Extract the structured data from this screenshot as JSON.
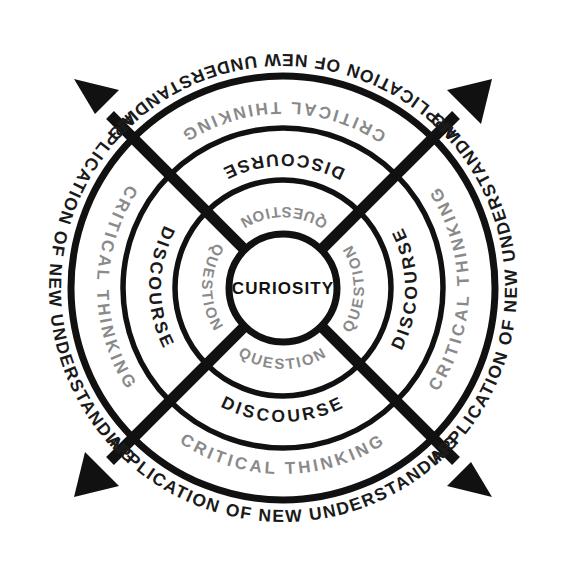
{
  "diagram": {
    "type": "concentric-ring-cycle",
    "center": {
      "label": "CURIOSITY",
      "color": "#111111",
      "radius": 54
    },
    "rings": [
      {
        "id": "question",
        "label": "QUESTION",
        "color": "#8a8a8a",
        "weight": "bold",
        "inner_radius": 54,
        "outer_radius": 108,
        "text_radius": 81,
        "repeats": 4,
        "positions": [
          "top",
          "right",
          "bottom",
          "left"
        ]
      },
      {
        "id": "discourse",
        "label": "DISCOURSE",
        "color": "#1a1a1a",
        "weight": "bold",
        "inner_radius": 108,
        "outer_radius": 160,
        "text_radius": 134,
        "repeats": 4,
        "positions": [
          "top",
          "right",
          "bottom",
          "left"
        ]
      },
      {
        "id": "critical-thinking",
        "label": "CRITICAL THINKING",
        "color": "#8a8a8a",
        "weight": "bold",
        "inner_radius": 160,
        "outer_radius": 212,
        "text_radius": 186,
        "repeats": 4,
        "positions": [
          "top",
          "right",
          "bottom",
          "left"
        ]
      },
      {
        "id": "application",
        "label": "APPLICATION OF NEW UNDERSTANDING",
        "color": "#1a1a1a",
        "weight": "bold",
        "inner_radius": 212,
        "outer_radius": 260,
        "text_radius": 234,
        "repeats": 4,
        "positions": [
          "top",
          "right",
          "bottom",
          "left"
        ]
      }
    ],
    "arrows": {
      "count": 4,
      "color": "#111111",
      "directions": [
        "top-left",
        "top-right",
        "bottom-right",
        "bottom-left"
      ],
      "description": "four outward-pointing diagonal arrows crossing the centre at 45 degrees"
    },
    "colors": {
      "ink": "#111111",
      "gray": "#8a8a8a",
      "background": "#ffffff"
    }
  }
}
